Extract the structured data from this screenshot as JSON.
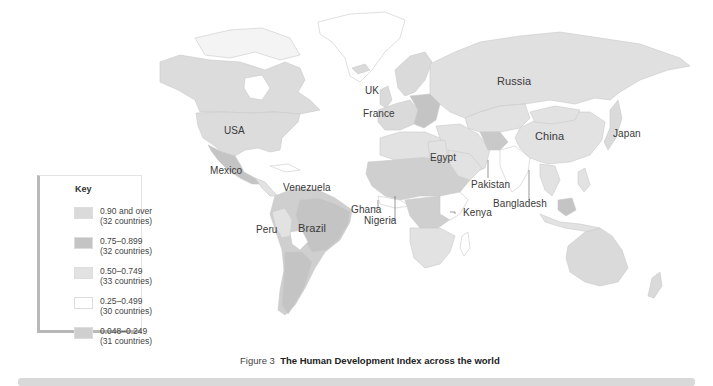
{
  "figure": {
    "caption_prefix": "Figure 3",
    "caption_title": "The Human Development Index across the world"
  },
  "legend": {
    "title": "Key",
    "items": [
      {
        "range": "0.90 and over",
        "count": "(32 countries)",
        "color": "#dadada"
      },
      {
        "range": "0.75–0.899",
        "count": "(32 countries)",
        "color": "#c4c4c4"
      },
      {
        "range": "0.50–0.749",
        "count": "(33 countries)",
        "color": "#e2e2e2"
      },
      {
        "range": "0.25–0.499",
        "count": "(30 countries)",
        "color": "#ffffff"
      },
      {
        "range": "0.048–0.249",
        "count": "(31 countries)",
        "color": "#cfcfcf"
      }
    ]
  },
  "labels": {
    "russia": "Russia",
    "uk": "UK",
    "france": "France",
    "usa": "USA",
    "china": "China",
    "japan": "Japan",
    "egypt": "Egypt",
    "pakistan": "Pakistan",
    "mexico": "Mexico",
    "venezuela": "Venezuela",
    "bangladesh": "Bangladesh",
    "ghana": "Ghana",
    "nigeria": "Nigeria",
    "kenya": "Kenya",
    "peru": "Peru",
    "brazil": "Brazil"
  },
  "colors": {
    "very_high": "#dadada",
    "high": "#c4c4c4",
    "medium": "#e2e2e2",
    "low": "#ffffff",
    "very_low": "#cfcfcf",
    "border": "#bdbdbd",
    "ocean": "#ffffff"
  }
}
